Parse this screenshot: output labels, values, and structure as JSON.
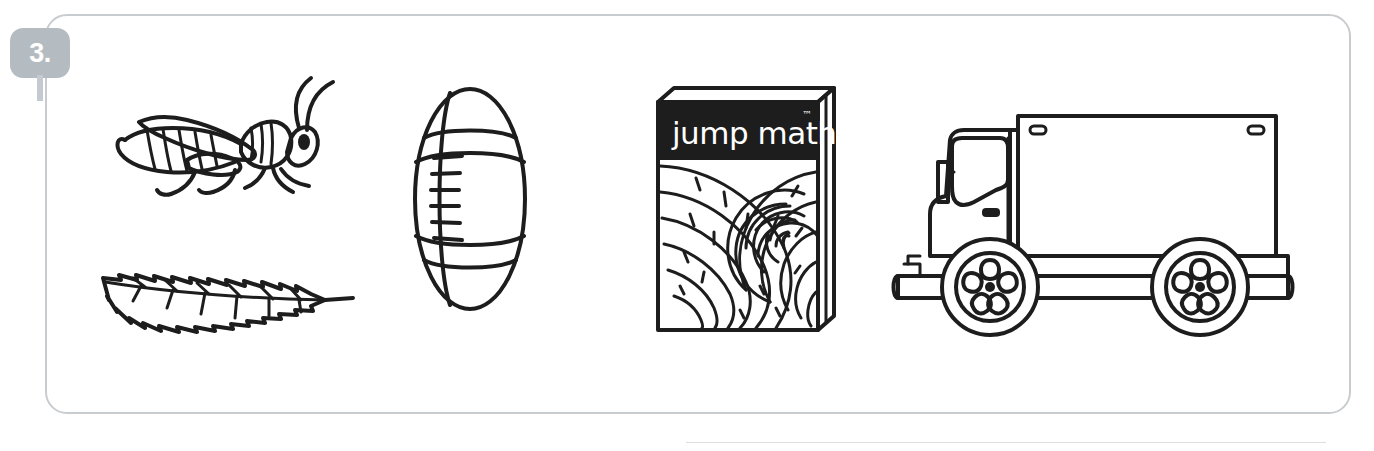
{
  "page": {
    "background_color": "#ffffff",
    "clipped_heading_text": "Circle the objects that have a line of symmetry."
  },
  "exercise": {
    "number_label": "3.",
    "badge_color": "#b5bcc1",
    "badge_text_color": "#ffffff",
    "frame_border_color": "#c9cccf",
    "ink_color": "#1d1d1d",
    "items": [
      {
        "id": "grasshopper",
        "name": "grasshopper",
        "icon": "grasshopper-icon",
        "description": "Line drawing of a grasshopper facing right with two long curved antennae"
      },
      {
        "id": "leaf",
        "name": "leaf",
        "icon": "leaf-icon",
        "description": "Line drawing of an elongated serrated leaf with central vein, tip at left and stem at right"
      },
      {
        "id": "football",
        "name": "football",
        "icon": "football-icon",
        "description": "Line drawing of an upright American football with laces on the left seam"
      },
      {
        "id": "book",
        "name": "jump math book",
        "icon": "book-icon",
        "title": "jump math",
        "trademark": "™",
        "description": "Line drawing of a book cover with a black title band and a nautilus spiral"
      },
      {
        "id": "truck",
        "name": "delivery truck",
        "icon": "truck-icon",
        "description": "Line drawing of a box delivery truck facing left with two spoked wheels"
      }
    ]
  },
  "footer": {
    "rule_color": "#dcdfe2"
  }
}
